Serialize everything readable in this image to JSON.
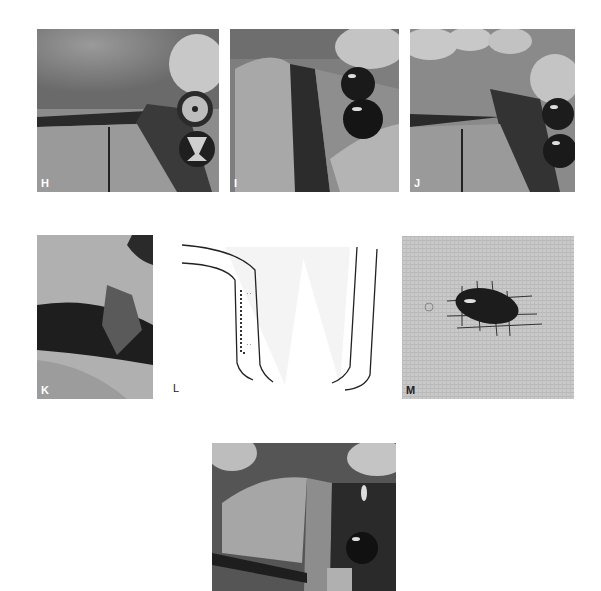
{
  "figure": {
    "panels": [
      {
        "id": "H",
        "label": "H",
        "type": "photo",
        "content": "surgical site with incision, two implant abutments"
      },
      {
        "id": "I",
        "label": "I",
        "type": "photo",
        "content": "surgical site with reflected flap, two dark implant heads"
      },
      {
        "id": "J",
        "label": "J",
        "type": "photo",
        "content": "surgical site with incision and two implants"
      },
      {
        "id": "K",
        "label": "K",
        "type": "photo",
        "content": "tissue graft being harvested with instrument"
      },
      {
        "id": "L",
        "label": "L",
        "type": "diagram",
        "content": "schematic of flap outlines with dotted incision line"
      },
      {
        "id": "M",
        "label": "M",
        "type": "photo",
        "content": "harvested tissue on gauze"
      },
      {
        "id": "N",
        "label": "",
        "type": "photo",
        "content": "graft placed over implant site"
      }
    ]
  }
}
